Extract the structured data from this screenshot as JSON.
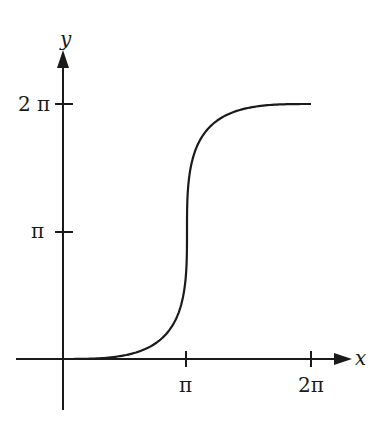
{
  "chart_data": {
    "type": "line",
    "title": "",
    "xlabel": "x",
    "ylabel": "y",
    "x_ticks": [
      "π",
      "2π"
    ],
    "y_ticks": [
      "π",
      "2π"
    ],
    "xlim": [
      0,
      6.2832
    ],
    "ylim": [
      0,
      6.2832
    ],
    "grid": false,
    "legend": null,
    "series": [
      {
        "name": "curve",
        "parametric": "x = θ + sin θ, y = θ − sin θ, θ ∈ [0, 2π]",
        "x": [
          0,
          0.03,
          0.22,
          0.66,
          1.39,
          2.26,
          3.14,
          4.02,
          4.89,
          5.62,
          6.06,
          6.25,
          6.28
        ],
        "y": [
          0,
          0.01,
          0.07,
          0.25,
          0.66,
          1.46,
          3.14,
          4.82,
          5.62,
          6.03,
          6.21,
          6.27,
          6.28
        ]
      }
    ],
    "annotations": [
      "Vertical tangent at (π, π)",
      "Horizontal tangents at (0,0) and (2π,2π)"
    ]
  },
  "axes": {
    "x_label": "x",
    "y_label": "y",
    "x_tick_labels": [
      "π",
      "2π"
    ],
    "y_tick_labels": [
      "π",
      "2 π"
    ]
  }
}
